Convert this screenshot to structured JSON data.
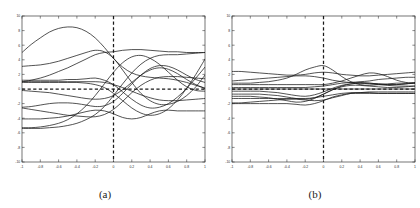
{
  "figure": {
    "background": "#ffffff",
    "line_color": "#1a1a1a",
    "axis_color": "#3a3a3a",
    "panels": [
      {
        "id": "a",
        "caption": "(a)"
      },
      {
        "id": "b",
        "caption": "(b)"
      }
    ]
  },
  "chart_data": [
    {
      "type": "line",
      "title": "",
      "subtitle": "",
      "panel": "(a)",
      "xlabel": "",
      "ylabel": "",
      "xlim": [
        -1,
        1
      ],
      "ylim": [
        -10,
        10
      ],
      "grid": false,
      "legend": "none",
      "xticks": [
        -1,
        -0.8,
        -0.6,
        -0.4,
        -0.2,
        0,
        0.2,
        0.4,
        0.6,
        0.8,
        1
      ],
      "xticklabels": [
        "-1",
        "-0.8",
        "-0.6",
        "-0.4",
        "-0.2",
        "0",
        "0.2",
        "0.4",
        "0.6",
        "0.8",
        "1"
      ],
      "yticks": [
        -10,
        -8,
        -6,
        -4,
        -2,
        0,
        2,
        4,
        6,
        8,
        10
      ],
      "yticklabels": [
        "-10",
        "-8",
        "-6",
        "-4",
        "-2",
        "0",
        "2",
        "4",
        "6",
        "8",
        "10"
      ],
      "annotations": [
        {
          "name": "zero-vertical-dashed-line",
          "type": "vline",
          "x": 0,
          "style": "dashed"
        },
        {
          "name": "zero-horizontal-dashed-line",
          "type": "hline",
          "y": 0,
          "style": "dashed"
        }
      ],
      "x": [
        -1,
        -0.9,
        -0.8,
        -0.7,
        -0.6,
        -0.5,
        -0.4,
        -0.3,
        -0.2,
        -0.1,
        0,
        0.1,
        0.2,
        0.3,
        0.4,
        0.5,
        0.6,
        0.7,
        0.8,
        0.9,
        1
      ],
      "series": [
        {
          "name": "curve-1",
          "values": [
            5.0,
            6.1,
            7.0,
            7.8,
            8.3,
            8.5,
            8.4,
            7.9,
            7.0,
            5.7,
            4.2,
            3.0,
            2.2,
            1.8,
            1.6,
            1.5,
            1.4,
            1.2,
            0.9,
            0.5,
            0.1
          ]
        },
        {
          "name": "curve-2",
          "values": [
            3.1,
            3.2,
            3.3,
            3.5,
            3.8,
            4.2,
            4.6,
            5.0,
            5.3,
            5.1,
            4.2,
            2.6,
            0.9,
            -0.6,
            -1.6,
            -2.1,
            -2.1,
            -1.7,
            -0.9,
            0.3,
            1.9
          ]
        },
        {
          "name": "curve-3",
          "values": [
            1.0,
            1.2,
            1.5,
            1.9,
            2.4,
            2.9,
            3.5,
            4.1,
            4.7,
            5.0,
            5.1,
            5.3,
            5.4,
            5.4,
            5.3,
            5.2,
            5.1,
            5.1,
            5.0,
            5.0,
            5.0
          ]
        },
        {
          "name": "curve-4",
          "values": [
            1.2,
            1.2,
            1.2,
            1.2,
            1.2,
            1.3,
            1.3,
            1.4,
            1.5,
            1.2,
            0.6,
            -0.4,
            -1.4,
            -2.2,
            -2.6,
            -2.5,
            -2.0,
            -1.1,
            0.1,
            1.5,
            3.0
          ]
        },
        {
          "name": "curve-5",
          "values": [
            1.0,
            1.0,
            1.0,
            1.0,
            1.0,
            1.0,
            1.0,
            1.0,
            1.0,
            0.9,
            0.6,
            0.2,
            -0.3,
            -0.8,
            -1.2,
            -1.5,
            -1.6,
            -1.6,
            -1.5,
            -1.4,
            -1.3
          ]
        },
        {
          "name": "curve-6",
          "values": [
            -0.2,
            -0.3,
            -0.4,
            -0.5,
            -0.7,
            -0.9,
            -1.1,
            -1.3,
            -1.4,
            -1.3,
            -0.9,
            -0.1,
            0.9,
            1.9,
            2.6,
            2.9,
            2.7,
            2.1,
            1.3,
            0.6,
            0.1
          ]
        },
        {
          "name": "curve-7",
          "values": [
            -2.5,
            -2.4,
            -2.2,
            -2.0,
            -1.9,
            -1.9,
            -2.0,
            -2.2,
            -2.4,
            -2.3,
            -1.7,
            -0.6,
            0.7,
            1.9,
            2.8,
            3.2,
            3.1,
            2.6,
            1.9,
            1.3,
            0.9
          ]
        },
        {
          "name": "curve-8",
          "values": [
            -2.6,
            -2.8,
            -3.0,
            -3.2,
            -3.4,
            -3.6,
            -3.7,
            -3.8,
            -3.8,
            -3.5,
            -2.8,
            -1.7,
            -0.5,
            0.5,
            1.2,
            1.6,
            1.7,
            1.7,
            1.6,
            1.5,
            1.4
          ]
        },
        {
          "name": "curve-9",
          "values": [
            -4.1,
            -4.1,
            -4.1,
            -4.0,
            -3.9,
            -3.7,
            -3.4,
            -3.1,
            -2.9,
            -3.0,
            -3.4,
            -3.9,
            -4.1,
            -3.9,
            -3.4,
            -3.0,
            -2.9,
            -3.0,
            -3.0,
            -3.0,
            -3.0
          ]
        },
        {
          "name": "curve-10",
          "values": [
            -5.4,
            -5.4,
            -5.4,
            -5.3,
            -5.2,
            -5.0,
            -4.7,
            -4.2,
            -3.5,
            -2.4,
            -0.9,
            0.7,
            2.2,
            3.4,
            4.2,
            4.6,
            4.7,
            4.7,
            4.8,
            4.9,
            5.0
          ]
        },
        {
          "name": "curve-11",
          "values": [
            -5.3,
            -5.3,
            -5.2,
            -5.0,
            -4.7,
            -4.2,
            -3.4,
            -2.3,
            -0.9,
            0.7,
            2.3,
            3.6,
            4.4,
            4.6,
            4.2,
            3.4,
            2.3,
            1.2,
            0.3,
            -0.2,
            -0.3
          ]
        },
        {
          "name": "curve-12",
          "values": [
            0.9,
            0.9,
            0.9,
            0.9,
            0.9,
            0.9,
            0.9,
            0.8,
            0.6,
            0.2,
            -0.6,
            -1.6,
            -2.6,
            -3.3,
            -3.6,
            -3.4,
            -2.7,
            -1.5,
            0.1,
            2.0,
            4.1
          ]
        }
      ]
    },
    {
      "type": "line",
      "title": "",
      "subtitle": "",
      "panel": "(b)",
      "xlabel": "",
      "ylabel": "",
      "xlim": [
        -1,
        1
      ],
      "ylim": [
        -10,
        10
      ],
      "grid": false,
      "legend": "none",
      "xticks": [
        -1,
        -0.8,
        -0.6,
        -0.4,
        -0.2,
        0,
        0.2,
        0.4,
        0.6,
        0.8,
        1
      ],
      "xticklabels": [
        "-1",
        "-0.8",
        "-0.6",
        "-0.4",
        "-0.2",
        "0",
        "0.2",
        "0.4",
        "0.6",
        "0.8",
        "1"
      ],
      "yticks": [
        -10,
        -8,
        -6,
        -4,
        -2,
        0,
        2,
        4,
        6,
        8,
        10
      ],
      "yticklabels": [
        "-10",
        "-8",
        "-6",
        "-4",
        "-2",
        "0",
        "2",
        "4",
        "6",
        "8",
        "10"
      ],
      "annotations": [
        {
          "name": "zero-vertical-dashed-line",
          "type": "vline",
          "x": 0,
          "style": "dashed"
        },
        {
          "name": "zero-horizontal-dashed-line",
          "type": "hline",
          "y": 0,
          "style": "dashed"
        }
      ],
      "x": [
        -1,
        -0.9,
        -0.8,
        -0.7,
        -0.6,
        -0.5,
        -0.4,
        -0.3,
        -0.2,
        -0.1,
        0,
        0.1,
        0.2,
        0.3,
        0.4,
        0.5,
        0.6,
        0.7,
        0.8,
        0.9,
        1
      ],
      "series": [
        {
          "name": "curve-1",
          "values": [
            2.4,
            2.4,
            2.3,
            2.2,
            2.1,
            2.0,
            1.9,
            1.9,
            2.0,
            2.2,
            2.3,
            2.2,
            2.0,
            1.9,
            1.8,
            1.8,
            1.9,
            2.0,
            2.1,
            2.2,
            2.3
          ]
        },
        {
          "name": "curve-2",
          "values": [
            1.1,
            1.2,
            1.3,
            1.4,
            1.5,
            1.6,
            1.7,
            1.8,
            1.8,
            1.7,
            1.5,
            1.2,
            1.0,
            0.9,
            1.0,
            1.1,
            1.3,
            1.4,
            1.5,
            1.6,
            1.6
          ]
        },
        {
          "name": "curve-3",
          "values": [
            0.8,
            0.8,
            0.8,
            0.9,
            1.0,
            1.2,
            1.5,
            2.0,
            2.6,
            3.0,
            3.2,
            2.6,
            1.7,
            1.0,
            0.6,
            0.5,
            0.6,
            0.7,
            0.8,
            0.8,
            0.8
          ]
        },
        {
          "name": "curve-4",
          "values": [
            0.6,
            0.6,
            0.6,
            0.6,
            0.6,
            0.6,
            0.6,
            0.6,
            0.6,
            0.6,
            0.6,
            0.8,
            1.1,
            1.5,
            1.9,
            2.2,
            2.1,
            1.7,
            1.2,
            0.9,
            0.8
          ]
        },
        {
          "name": "curve-5",
          "values": [
            0.2,
            0.2,
            0.2,
            0.2,
            0.2,
            0.2,
            0.2,
            0.2,
            0.2,
            0.3,
            0.4,
            0.6,
            0.8,
            0.9,
            0.9,
            0.8,
            0.7,
            0.6,
            0.6,
            0.7,
            0.9
          ]
        },
        {
          "name": "curve-6",
          "values": [
            0.0,
            0.0,
            0.0,
            0.0,
            0.0,
            0.0,
            0.0,
            0.0,
            0.0,
            0.0,
            0.0,
            0.0,
            0.0,
            0.0,
            0.0,
            0.0,
            0.0,
            0.0,
            0.0,
            0.0,
            0.0
          ]
        },
        {
          "name": "curve-7",
          "values": [
            -0.3,
            -0.3,
            -0.3,
            -0.3,
            -0.4,
            -0.5,
            -0.7,
            -0.9,
            -1.0,
            -0.8,
            -0.4,
            0.1,
            0.5,
            0.7,
            0.8,
            0.7,
            0.6,
            0.5,
            0.4,
            0.4,
            0.4
          ]
        },
        {
          "name": "curve-8",
          "values": [
            -0.7,
            -0.7,
            -0.7,
            -0.7,
            -0.8,
            -0.9,
            -1.1,
            -1.3,
            -1.4,
            -1.2,
            -0.7,
            -0.1,
            0.4,
            0.7,
            0.8,
            0.8,
            0.7,
            0.6,
            0.6,
            0.7,
            0.8
          ]
        },
        {
          "name": "curve-9",
          "values": [
            -1.0,
            -1.0,
            -1.0,
            -1.1,
            -1.2,
            -1.4,
            -1.6,
            -1.8,
            -1.7,
            -1.3,
            -0.7,
            -0.1,
            0.3,
            0.5,
            0.5,
            0.4,
            0.3,
            0.2,
            0.2,
            0.3,
            0.4
          ]
        },
        {
          "name": "curve-10",
          "values": [
            -1.3,
            -1.3,
            -1.3,
            -1.3,
            -1.3,
            -1.3,
            -1.3,
            -1.3,
            -1.3,
            -1.2,
            -1.0,
            -0.8,
            -0.6,
            -0.5,
            -0.5,
            -0.5,
            -0.6,
            -0.6,
            -0.6,
            -0.6,
            -0.6
          ]
        },
        {
          "name": "curve-11",
          "values": [
            -1.9,
            -1.9,
            -1.8,
            -1.7,
            -1.6,
            -1.5,
            -1.4,
            -1.4,
            -1.5,
            -1.6,
            -1.5,
            -1.2,
            -0.9,
            -0.6,
            -0.5,
            -0.4,
            -0.4,
            -0.4,
            -0.4,
            -0.4,
            -0.4
          ]
        },
        {
          "name": "curve-12",
          "values": [
            -2.0,
            -2.0,
            -2.0,
            -2.0,
            -2.0,
            -2.0,
            -2.0,
            -2.1,
            -2.2,
            -2.0,
            -1.6,
            -1.1,
            -0.8,
            -0.6,
            -0.6,
            -0.6,
            -0.6,
            -0.6,
            -0.6,
            -0.6,
            -0.6
          ]
        }
      ]
    }
  ]
}
